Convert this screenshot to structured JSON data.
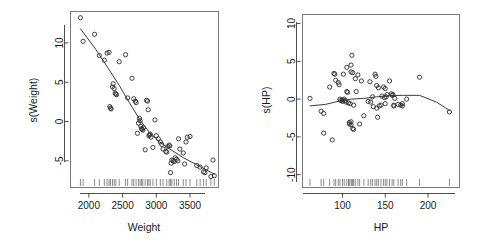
{
  "figure": {
    "background": "#ffffff",
    "point_color": "#2b2b2b",
    "line_color": "#3a3a3a",
    "axis_color": "#4d4d4d",
    "layout": "two panels side by side, 1 row x 2 columns"
  },
  "chart_data": [
    {
      "type": "scatter",
      "panel_name": "weight-partial-effect",
      "title": "",
      "xlabel": "Weight",
      "ylabel": "s(Weight)",
      "xlim": [
        1750,
        3900
      ],
      "ylim": [
        -8.2,
        13.8
      ],
      "xticks": [
        2000,
        2500,
        3000,
        3500
      ],
      "yticks": [
        10,
        5,
        0,
        -5
      ],
      "grid": false,
      "legend": null,
      "marker": "open-circle",
      "x": [
        1875,
        1915,
        2085,
        2155,
        2230,
        2270,
        2300,
        2310,
        2320,
        2330,
        2350,
        2360,
        2375,
        2390,
        2400,
        2410,
        2450,
        2545,
        2575,
        2640,
        2665,
        2690,
        2700,
        2720,
        2735,
        2750,
        2760,
        2770,
        2780,
        2790,
        2800,
        2810,
        2835,
        2855,
        2870,
        2880,
        2890,
        2900,
        2910,
        2920,
        2950,
        2980,
        3000,
        3030,
        3060,
        3080,
        3100,
        3140,
        3155,
        3170,
        3190,
        3200,
        3210,
        3220,
        3230,
        3250,
        3265,
        3280,
        3300,
        3320,
        3330,
        3350,
        3400,
        3420,
        3440,
        3460,
        3500,
        3600,
        3650,
        3700,
        3720,
        3740,
        3810,
        3840,
        3860
      ],
      "y": [
        13.2,
        10.2,
        11.1,
        8.4,
        7.8,
        8.7,
        8.8,
        1.9,
        1.7,
        1.6,
        4.4,
        4.8,
        4.2,
        3.6,
        3.5,
        3.4,
        7.6,
        8.5,
        3.0,
        5.5,
        2.9,
        2.6,
        2.4,
        -1.5,
        -0.2,
        0.4,
        0.1,
        -0.6,
        -0.9,
        -1.0,
        -1.1,
        -0.8,
        -3.6,
        2.7,
        2.6,
        1.5,
        -1.8,
        -1.7,
        -1.6,
        -2.0,
        -3.3,
        0.2,
        -1.8,
        -2.2,
        -2.6,
        -2.9,
        -3.5,
        -3.8,
        -3.9,
        -3.2,
        -3.0,
        -3.1,
        -6.5,
        -5.3,
        -4.9,
        -5.0,
        -5.1,
        -4.6,
        -4.8,
        -5.0,
        -2.2,
        -3.5,
        -4.0,
        -5.4,
        -2.6,
        -2.0,
        -1.9,
        -5.6,
        -5.8,
        -6.4,
        -6.5,
        -5.9,
        -7.0,
        -4.9,
        -6.9
      ],
      "smooth_line": {
        "description": "GAM smooth partial effect, steep monotone decline",
        "x": [
          1875,
          2100,
          2300,
          2450,
          2600,
          2750,
          2900,
          3050,
          3200,
          3400,
          3600,
          3860
        ],
        "y": [
          11.8,
          9.2,
          6.6,
          4.6,
          2.4,
          0.3,
          -1.4,
          -2.6,
          -3.5,
          -4.6,
          -5.5,
          -6.7
        ]
      },
      "rug": {
        "position": "bottom inside axis",
        "values": [
          1875,
          1915,
          2085,
          2155,
          2230,
          2270,
          2300,
          2320,
          2350,
          2375,
          2400,
          2450,
          2545,
          2575,
          2640,
          2665,
          2700,
          2735,
          2760,
          2780,
          2800,
          2835,
          2870,
          2890,
          2910,
          2950,
          3000,
          3060,
          3100,
          3155,
          3190,
          3210,
          3230,
          3265,
          3300,
          3330,
          3400,
          3440,
          3500,
          3600,
          3650,
          3700,
          3740,
          3810,
          3860
        ]
      }
    },
    {
      "type": "scatter",
      "panel_name": "hp-partial-effect",
      "title": "",
      "xlabel": "HP",
      "ylabel": "s(HP)",
      "xlim": [
        55,
        235
      ],
      "ylim": [
        -11.5,
        11.0
      ],
      "xticks": [
        100,
        150,
        200
      ],
      "yticks": [
        10,
        5,
        0,
        -5,
        -10
      ],
      "grid": false,
      "legend": null,
      "marker": "open-circle",
      "x": [
        62,
        75,
        78,
        78,
        85,
        88,
        90,
        91,
        92,
        95,
        96,
        97,
        98,
        100,
        100,
        101,
        102,
        103,
        104,
        105,
        105,
        106,
        107,
        108,
        108,
        109,
        110,
        110,
        110,
        110,
        111,
        112,
        112,
        113,
        113,
        115,
        116,
        118,
        120,
        122,
        125,
        130,
        132,
        133,
        135,
        136,
        138,
        139,
        140,
        140,
        141,
        142,
        143,
        145,
        146,
        148,
        149,
        150,
        150,
        151,
        152,
        155,
        157,
        158,
        159,
        160,
        160,
        161,
        165,
        168,
        170,
        170,
        175,
        190,
        225
      ],
      "y": [
        0.1,
        -1.6,
        -1.9,
        -4.5,
        1.6,
        -5.4,
        3.4,
        3.3,
        2.5,
        2.2,
        1.9,
        0.0,
        -0.2,
        -0.1,
        -0.3,
        3.3,
        0.0,
        -0.2,
        -0.4,
        4.2,
        1.0,
        0.9,
        -0.5,
        -3.1,
        -3.3,
        -0.6,
        4.5,
        3.6,
        -3.0,
        -3.4,
        5.8,
        3.5,
        -3.9,
        -0.8,
        -4.0,
        2.7,
        1.0,
        3.2,
        -3.3,
        2.4,
        -2.2,
        -0.3,
        2.3,
        -0.4,
        0.3,
        -1.0,
        3.3,
        3.0,
        1.8,
        -1.2,
        -2.4,
        1.5,
        -0.9,
        -0.8,
        0.4,
        1.6,
        0.2,
        1.4,
        -0.6,
        0.3,
        0.6,
        2.4,
        0.7,
        0.5,
        0.6,
        -0.8,
        -0.9,
        0.1,
        -0.7,
        -0.8,
        -0.6,
        -0.9,
        0.0,
        2.9,
        -1.7
      ],
      "smooth_line": {
        "description": "GAM smooth partial effect, nearly flat near zero then declining above 190 HP",
        "x": [
          62,
          80,
          95,
          110,
          125,
          140,
          155,
          170,
          190,
          210,
          225
        ],
        "y": [
          -0.9,
          -0.7,
          -0.3,
          0.0,
          0.1,
          0.3,
          0.45,
          0.5,
          0.5,
          -0.4,
          -1.5
        ]
      },
      "rug": {
        "position": "bottom inside axis",
        "values": [
          62,
          75,
          78,
          85,
          90,
          92,
          95,
          97,
          100,
          102,
          105,
          107,
          108,
          110,
          111,
          112,
          113,
          115,
          118,
          120,
          125,
          130,
          133,
          135,
          138,
          140,
          142,
          145,
          148,
          150,
          152,
          155,
          158,
          160,
          165,
          168,
          170,
          175,
          190,
          225
        ]
      }
    }
  ]
}
